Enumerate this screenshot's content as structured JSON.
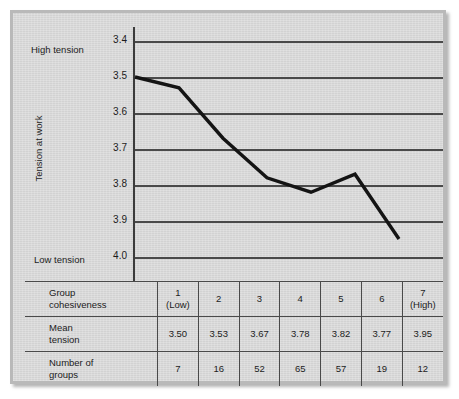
{
  "chart_data": {
    "type": "line",
    "title": "",
    "xlabel": "Group cohesiveness",
    "ylabel": "Tension at work",
    "categories": [
      "1",
      "2",
      "3",
      "4",
      "5",
      "6",
      "7"
    ],
    "category_sublabels": [
      "(Low)",
      "",
      "",
      "",
      "",
      "",
      "(High)"
    ],
    "values": [
      3.5,
      3.53,
      3.67,
      3.78,
      3.82,
      3.77,
      3.95
    ],
    "counts": [
      7,
      16,
      52,
      65,
      57,
      19,
      12
    ],
    "yticks": [
      "3.4",
      "3.5",
      "3.6",
      "3.7",
      "3.8",
      "3.9",
      "4.0"
    ],
    "ylim": [
      3.4,
      4.0
    ],
    "y_axis_inverted": true,
    "grid": true,
    "legend": "none",
    "annotations": {
      "top": "High tension",
      "bottom": "Low tension"
    },
    "line_color": "#141414"
  },
  "axis": {
    "y_title": "Tension at work",
    "high_label": "High tension",
    "low_label": "Low tension",
    "ticks": [
      "3.4",
      "3.5",
      "3.6",
      "3.7",
      "3.8",
      "3.9",
      "4.0"
    ]
  },
  "table": {
    "rows": [
      {
        "header": "Group",
        "header_sub": "cohesiveness",
        "cells": [
          "1",
          "2",
          "3",
          "4",
          "5",
          "6",
          "7"
        ],
        "cells_sub": [
          "(Low)",
          "",
          "",
          "",
          "",
          "",
          "(High)"
        ]
      },
      {
        "header": "Mean",
        "header_sub": "tension",
        "cells": [
          "3.50",
          "3.53",
          "3.67",
          "3.78",
          "3.82",
          "3.77",
          "3.95"
        ],
        "cells_sub": [
          "",
          "",
          "",
          "",
          "",
          "",
          ""
        ]
      },
      {
        "header": "Number of",
        "header_sub": "groups",
        "cells": [
          "7",
          "16",
          "52",
          "65",
          "57",
          "19",
          "12"
        ],
        "cells_sub": [
          "",
          "",
          "",
          "",
          "",
          "",
          ""
        ]
      }
    ]
  },
  "colors": {
    "panel": "#d7d7d7",
    "frame": "#b9b9b9",
    "grid": "#4a4a4a",
    "line": "#141414",
    "text": "#1c1c1c"
  }
}
